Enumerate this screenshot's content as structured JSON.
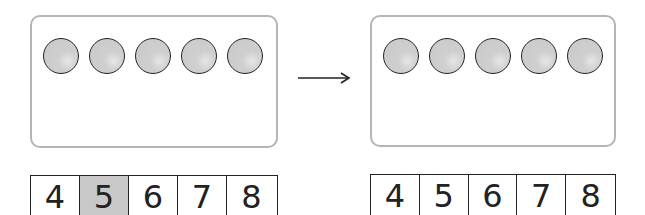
{
  "left_panel": {
    "counters": 5,
    "number_strip": {
      "values": [
        "4",
        "5",
        "6",
        "7",
        "8"
      ],
      "highlighted_index": 1
    }
  },
  "arrow": {
    "direction": "right"
  },
  "right_panel": {
    "counters": 5,
    "number_strip": {
      "values": [
        "4",
        "5",
        "6",
        "7",
        "8"
      ],
      "highlighted_index": null
    }
  },
  "colors": {
    "frame_border": "#b5b5b5",
    "counter_fill": "#cfcfcf",
    "highlight": "#c8c8c8",
    "ink": "#222222"
  }
}
